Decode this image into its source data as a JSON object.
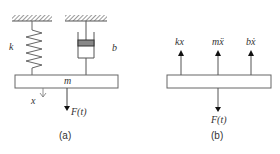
{
  "panel_a": {
    "caption": "(a)",
    "spring_label": "k",
    "damper_label": "b",
    "mass_label": "m",
    "displacement_label": "x",
    "force_label": "F(t)"
  },
  "panel_b": {
    "caption": "(b)",
    "forces_up": [
      "kx",
      "mẍ",
      "bẋ"
    ],
    "force_down": "F(t)"
  },
  "colors": {
    "line": "#555555",
    "text": "#333333",
    "piston": "#777777"
  }
}
